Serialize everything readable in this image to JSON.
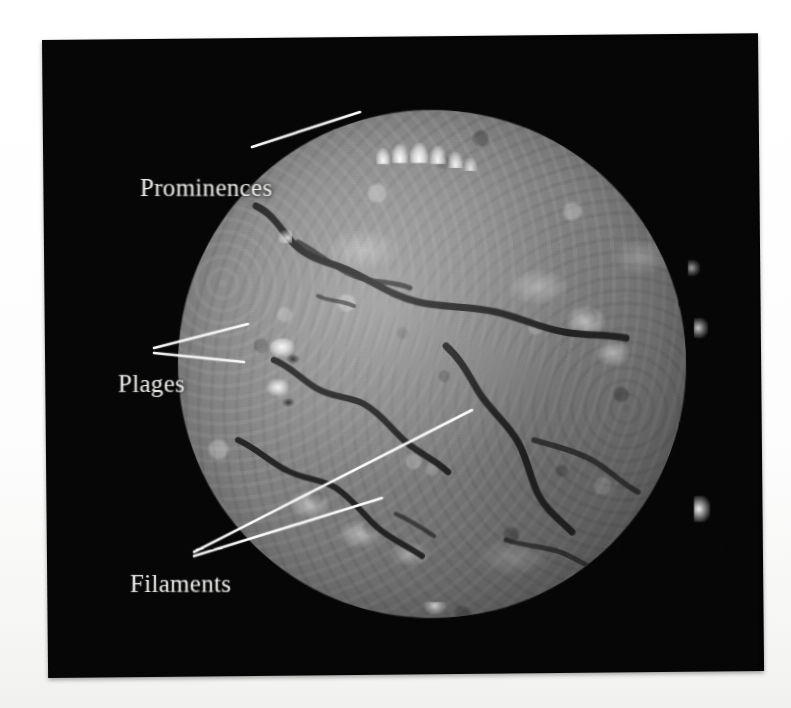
{
  "figure": {
    "medium": "black-and-white photographic plate",
    "background_color": "#ffffff",
    "plate_color": "#040404"
  },
  "annotations": [
    {
      "id": "prominences",
      "label": "Prominences",
      "target": "bright eruptive structures on the upper solar limb",
      "leader_count": 1
    },
    {
      "id": "plages",
      "label": "Plages",
      "target": "two bright patches on the left side of the disk",
      "leader_count": 2
    },
    {
      "id": "filaments",
      "label": "Filaments",
      "target": "two dark sinuous channels across the disk",
      "leader_count": 2
    }
  ],
  "sun": {
    "disk": {
      "center_x": 430,
      "center_y": 364,
      "radius": 254
    },
    "limb_features": {
      "prominences": [
        {
          "x": 352,
          "y": 120
        },
        {
          "x": 368,
          "y": 117
        },
        {
          "x": 384,
          "y": 120
        },
        {
          "x": 401,
          "y": 123
        },
        {
          "x": 416,
          "y": 128
        },
        {
          "x": 246,
          "y": 197
        },
        {
          "x": 666,
          "y": 462
        },
        {
          "x": 664,
          "y": 287
        }
      ]
    },
    "plages": [
      {
        "x": 239,
        "y": 314,
        "size": 18,
        "intensity": "bright"
      },
      {
        "x": 237,
        "y": 353,
        "size": 16,
        "intensity": "bright"
      },
      {
        "x": 540,
        "y": 290,
        "size": 16,
        "intensity": "medium"
      },
      {
        "x": 566,
        "y": 320,
        "size": 13,
        "intensity": "medium"
      },
      {
        "x": 654,
        "y": 396,
        "size": 17,
        "intensity": "bright"
      },
      {
        "x": 270,
        "y": 467,
        "size": 14,
        "intensity": "medium"
      },
      {
        "x": 318,
        "y": 497,
        "size": 13,
        "intensity": "medium"
      },
      {
        "x": 300,
        "y": 290,
        "size": 12,
        "intensity": "soft"
      },
      {
        "x": 380,
        "y": 300,
        "size": 11,
        "intensity": "soft"
      }
    ],
    "filament_paths": [
      "long arc running from the north-east limb down across the disk centre",
      "lower arc curving from the south-west toward disk centre"
    ]
  },
  "colors": {
    "label_text": "#f4f4f2",
    "leader_line": "#ffffff",
    "photo_black": "#040404",
    "page_white": "#ffffff"
  }
}
